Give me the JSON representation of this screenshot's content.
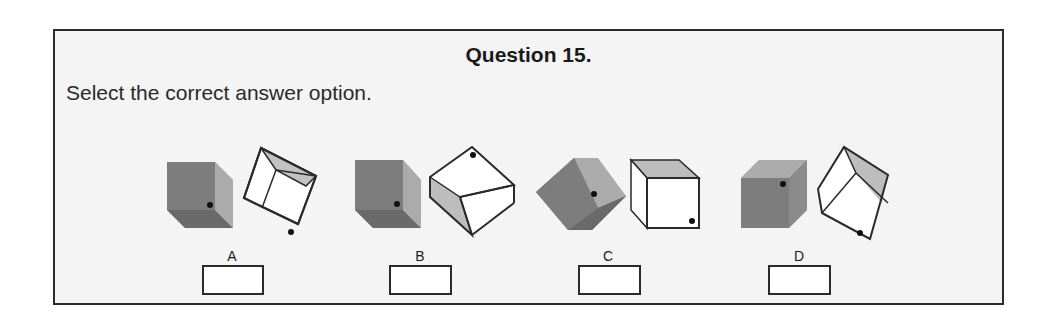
{
  "question": {
    "title": "Question 15.",
    "prompt": "Select the correct answer option."
  },
  "options": [
    {
      "label": "A"
    },
    {
      "label": "B"
    },
    {
      "label": "C"
    },
    {
      "label": "D"
    }
  ],
  "colors": {
    "cube_dark_front": "#7a7a7a",
    "cube_dark_side": "#a8a8a8",
    "cube_dark_bottom": "#6a6a6a",
    "cube_white_face": "#ffffff",
    "cube_white_shade": "#bdbdbd",
    "outline": "#2a2a2a",
    "background": "#f4f4f4"
  }
}
